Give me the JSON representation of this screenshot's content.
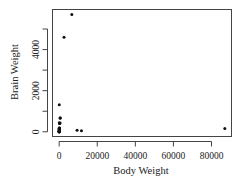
{
  "chart_data": {
    "type": "scatter",
    "title": "",
    "xlabel": "Body Weight",
    "ylabel": "Brain Weight",
    "xlim": [
      -3500,
      90500
    ],
    "ylim": [
      -230,
      5950
    ],
    "x_ticks": [
      0,
      20000,
      40000,
      60000,
      80000
    ],
    "x_tick_labels": [
      "0",
      "20000",
      "40000",
      "60000",
      "80000"
    ],
    "y_ticks": [
      0,
      1000,
      2000,
      3000,
      4000,
      5000
    ],
    "y_tick_labels": [
      "0",
      "",
      "2000",
      "",
      "4000",
      ""
    ],
    "grid": false,
    "legend": null,
    "points": [
      {
        "x": 87000,
        "y": 154.5
      },
      {
        "x": 11700,
        "y": 50
      },
      {
        "x": 9400,
        "y": 70
      },
      {
        "x": 6654,
        "y": 5712
      },
      {
        "x": 2547,
        "y": 4603
      },
      {
        "x": 62,
        "y": 1320
      },
      {
        "x": 521,
        "y": 655
      },
      {
        "x": 465,
        "y": 423
      },
      {
        "x": 529,
        "y": 680
      },
      {
        "x": 207,
        "y": 406
      },
      {
        "x": 187.1,
        "y": 419
      },
      {
        "x": 52.16,
        "y": 440
      },
      {
        "x": 35,
        "y": 56
      },
      {
        "x": 27.66,
        "y": 115
      },
      {
        "x": 100,
        "y": 157
      },
      {
        "x": 6.8,
        "y": 179
      },
      {
        "x": 55.5,
        "y": 175
      },
      {
        "x": 1.35,
        "y": 8.1
      },
      {
        "x": 0.28,
        "y": 1.9
      },
      {
        "x": 10,
        "y": 115
      },
      {
        "x": 3.3,
        "y": 25.6
      },
      {
        "x": 0.023,
        "y": 0.4
      },
      {
        "x": 0.12,
        "y": 1
      },
      {
        "x": 0.101,
        "y": 4
      },
      {
        "x": 1.04,
        "y": 5.5
      },
      {
        "x": 0.425,
        "y": 6.4
      },
      {
        "x": 3.385,
        "y": 44.5
      },
      {
        "x": 192,
        "y": 180
      }
    ],
    "point_color": "#111111"
  }
}
